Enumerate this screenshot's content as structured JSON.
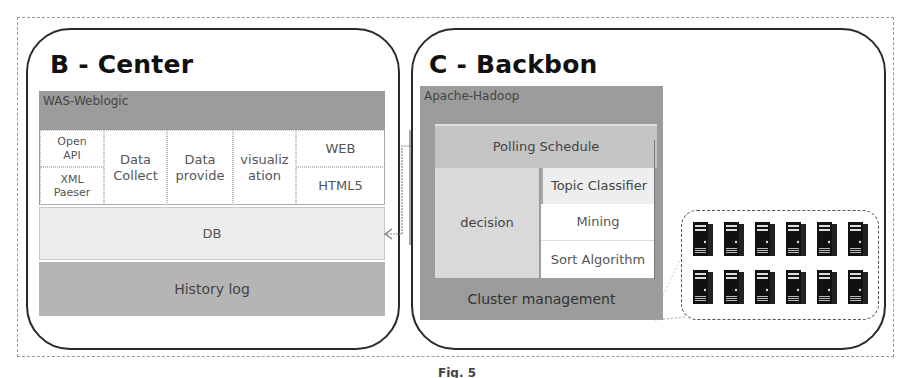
{
  "diagram": {
    "caption": "Fig. 5",
    "center_panel": {
      "title": "B - Center",
      "server_bar": "WAS-Weblogic",
      "modules": {
        "open_api": "Open API",
        "xml_parser": "XML Paeser",
        "data_collect": "Data Collect",
        "data_provide": "Data provide",
        "visualization": "visualiz ation",
        "web": "WEB",
        "html5": "HTML5"
      },
      "db": "DB",
      "history_log": "History log"
    },
    "backbone_panel": {
      "title": "C - Backbon",
      "server_bar": "Apache-Hadoop",
      "polling_schedule": "Polling Schedule",
      "decision": "decision",
      "topic_classifier": "Topic Classifier",
      "mining": "Mining",
      "sort_algorithm": "Sort Algorithm",
      "cluster_management": "Cluster management"
    },
    "server_cluster": {
      "rows": 2,
      "columns": 6,
      "icon": "server-tower-icon"
    },
    "connector": "bidirectional-arrow DB <-> Polling Schedule",
    "colors": {
      "dark_bar": "#9c9c9c",
      "medium_bar": "#b5b5b5",
      "light_bar": "#d9d9d9",
      "db_fill": "#ececec",
      "border": "#2a2a2a"
    }
  }
}
